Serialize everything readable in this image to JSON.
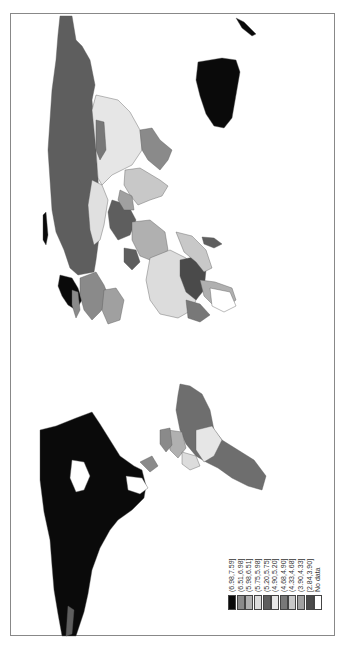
{
  "map": {
    "type": "choropleth",
    "orientation": "rotated -90deg",
    "projection": "world",
    "palette": "grayscale"
  },
  "legend": {
    "items": [
      {
        "label": "(6.98,7.59]",
        "color": "#0a0a0a"
      },
      {
        "label": "(6.51,6.98]",
        "color": "#8a8a8a"
      },
      {
        "label": "(5.98,6.51]",
        "color": "#b0b0b0"
      },
      {
        "label": "(5.75,5.98]",
        "color": "#dcdcdc"
      },
      {
        "label": "(5.20,5.75]",
        "color": "#5e5e5e"
      },
      {
        "label": "(4.90,5.20]",
        "color": "#e6e6e6"
      },
      {
        "label": "(4.68,4.90]",
        "color": "#787878"
      },
      {
        "label": "(4.33,4.68]",
        "color": "#c8c8c8"
      },
      {
        "label": "(3.90,4.33]",
        "color": "#a0a0a0"
      },
      {
        "label": "[2.84,3.90]",
        "color": "#4a4a4a"
      },
      {
        "label": "No data",
        "color": "#ffffff"
      }
    ]
  },
  "regions": {
    "north_america": {
      "class": "(6.98,7.59]",
      "color": "#0a0a0a"
    },
    "greenland": {
      "class": "(6.98,7.59]",
      "color": "#0a0a0a"
    },
    "russia": {
      "class": "(5.20,5.75]",
      "color": "#5e5e5e"
    },
    "australia": {
      "class": "(6.98,7.59]",
      "color": "#0a0a0a"
    },
    "brazil": {
      "class": "(5.20,5.75]",
      "color": "#6e6e6e"
    },
    "china": {
      "class": "(4.90,5.20]",
      "color": "#e6e6e6"
    },
    "india": {
      "class": "(4.33,4.68]",
      "color": "#c8c8c8"
    },
    "kazakhstan": {
      "class": "(4.90,5.20]",
      "color": "#e0e0e0"
    }
  }
}
